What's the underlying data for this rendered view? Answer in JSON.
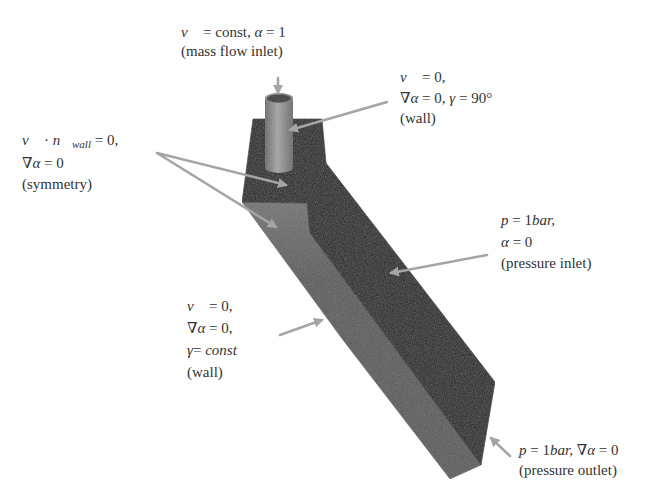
{
  "boundary_conditions": [
    {
      "id": "mass_flow_inlet",
      "equations": [
        [
          "v⃗",
          " = const, ",
          "α",
          " = 1"
        ]
      ],
      "type": "(mass flow inlet)"
    },
    {
      "id": "wall_top",
      "equations": [
        [
          "v⃗",
          " = 0,"
        ],
        [
          "∇α",
          " = 0, ",
          "γ",
          " = 90°"
        ]
      ],
      "type": "(wall)"
    },
    {
      "id": "symmetry",
      "equations": [
        [
          "v⃗",
          " · ",
          "n⃗",
          "wall",
          " = 0,"
        ],
        [
          "∇α",
          " = 0"
        ]
      ],
      "type": "(symmetry)"
    },
    {
      "id": "pressure_inlet",
      "equations": [
        [
          "p",
          " = 1",
          "bar",
          ","
        ],
        [
          "α",
          " = 0"
        ]
      ],
      "type": "(pressure inlet)"
    },
    {
      "id": "wall_side",
      "equations": [
        [
          "v⃗",
          " = 0,"
        ],
        [
          "∇α",
          " = 0,"
        ],
        [
          "γ",
          "= ",
          "const"
        ]
      ],
      "type": "(wall)"
    },
    {
      "id": "pressure_outlet",
      "equations": [
        [
          "p",
          " = 1",
          "bar",
          ", ",
          "∇α",
          " = 0"
        ]
      ],
      "type": "(pressure outlet)"
    }
  ],
  "colors": {
    "dark_face": "#1c1c1c",
    "side_face_light": "#727272",
    "side_face": "#585858",
    "pipe_light": "#a6a6a6",
    "pipe_dark": "#686868",
    "pipe_opening": "#2e2e2e",
    "leader_arrow": "#a5a5a5",
    "text": "#333333"
  }
}
